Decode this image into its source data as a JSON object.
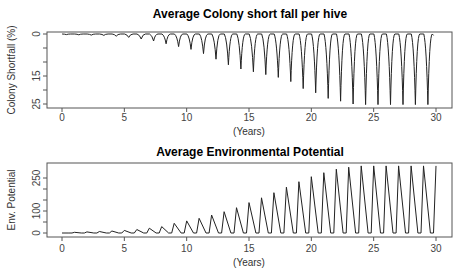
{
  "chart_data": [
    {
      "type": "line",
      "title": "Average Colony short fall per hive",
      "xlabel": "(Years)",
      "ylabel": "Colony Shortfall (%)",
      "xlim": [
        0,
        30
      ],
      "ylim": [
        25,
        0
      ],
      "y_inverted": true,
      "x_ticks": [
        0,
        5,
        10,
        15,
        20,
        25,
        30
      ],
      "x_tick_labels": [
        "0",
        "5",
        "10",
        "15",
        "20",
        "25",
        "30"
      ],
      "y_ticks": [
        0,
        5,
        10,
        15,
        20,
        25
      ],
      "y_tick_labels": [
        "0",
        "",
        "",
        "15",
        "",
        "25"
      ],
      "grid": false,
      "legend": null,
      "description": "Periodic annual dips near year N+0.35; plateau near 0 between dips; dip depth grows over time and saturates near 25.",
      "series": [
        {
          "name": "Colony shortfall",
          "dip_years": [
            0.35,
            1.35,
            2.35,
            3.35,
            4.35,
            5.35,
            6.35,
            7.35,
            8.35,
            9.35,
            10.35,
            11.35,
            12.35,
            13.35,
            14.35,
            15.35,
            16.35,
            17.35,
            18.35,
            19.35,
            20.35,
            21.35,
            22.35,
            23.35,
            24.35,
            25.35,
            26.35,
            27.35,
            28.35,
            29.35
          ],
          "dip_values": [
            0.2,
            0.3,
            0.4,
            0.5,
            0.8,
            1.2,
            1.8,
            2.5,
            3.5,
            4.5,
            5.5,
            7.0,
            9.0,
            11.0,
            12.5,
            13.5,
            14.5,
            15.5,
            17.0,
            19.5,
            21.0,
            23.0,
            24.0,
            25.0,
            25.2,
            25.2,
            25.2,
            25.2,
            25.2,
            25.2
          ],
          "end_year": 29.8,
          "end_value": 0.5
        }
      ]
    },
    {
      "type": "line",
      "title": "Average Environmental Potential",
      "xlabel": "(Years)",
      "ylabel": "Env. Potential",
      "xlim": [
        0,
        30
      ],
      "ylim": [
        0,
        300
      ],
      "x_ticks": [
        0,
        5,
        10,
        15,
        20,
        25,
        30
      ],
      "x_tick_labels": [
        "0",
        "5",
        "10",
        "15",
        "20",
        "25",
        "30"
      ],
      "y_ticks": [
        0,
        50,
        100,
        150,
        200,
        250
      ],
      "y_tick_labels": [
        "0",
        "",
        "100",
        "",
        "",
        "250"
      ],
      "grid": false,
      "legend": null,
      "description": "Annual triangular peaks at integer years, returning to 0 between peaks; peak height grows and saturates near 305.",
      "series": [
        {
          "name": "Environmental potential",
          "peak_years": [
            1,
            2,
            3,
            4,
            5,
            6,
            7,
            8,
            9,
            10,
            11,
            12,
            13,
            14,
            15,
            16,
            17,
            18,
            19,
            20,
            21,
            22,
            23,
            24,
            25,
            26,
            27,
            28,
            29,
            30
          ],
          "peak_values": [
            3,
            5,
            7,
            9,
            12,
            16,
            22,
            29,
            44,
            55,
            67,
            82,
            97,
            115,
            138,
            160,
            183,
            208,
            233,
            256,
            274,
            290,
            299,
            305,
            305,
            305,
            305,
            305,
            305,
            305
          ]
        }
      ]
    }
  ],
  "plots": {
    "top": {
      "title": "Average Colony short fall per hive",
      "ylabel": "Colony Shortfall (%)",
      "xlabel": "(Years)"
    },
    "bottom": {
      "title": "Average Environmental Potential",
      "ylabel": "Env. Potential",
      "xlabel": "(Years)"
    }
  }
}
